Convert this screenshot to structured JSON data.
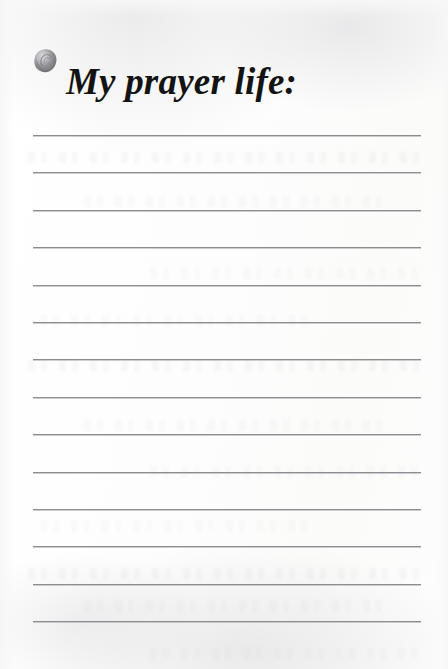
{
  "page": {
    "kind": "journal-prompt-page",
    "background_color": "#fdfdfc",
    "width": 448,
    "height": 669
  },
  "header": {
    "title": "My prayer life:",
    "title_color": "#131313",
    "ornament": {
      "icon_name": "rose-bud-icon",
      "description": "small grayscale rose bud illustration used as a bullet",
      "color_dark": "#6e6e70",
      "color_mid": "#95959a",
      "color_light": "#bcbcc0"
    }
  },
  "writing_area": {
    "line_color": "#8d8d90",
    "line_count": 14,
    "line_left": 33,
    "line_right": 421,
    "first_line_y": 135,
    "line_spacing": 37.4,
    "lines": [
      {
        "index": 1,
        "y": 135,
        "value": ""
      },
      {
        "index": 2,
        "y": 172,
        "value": ""
      },
      {
        "index": 3,
        "y": 210,
        "value": ""
      },
      {
        "index": 4,
        "y": 247,
        "value": ""
      },
      {
        "index": 5,
        "y": 285,
        "value": ""
      },
      {
        "index": 6,
        "y": 322,
        "value": ""
      },
      {
        "index": 7,
        "y": 359,
        "value": ""
      },
      {
        "index": 8,
        "y": 397,
        "value": ""
      },
      {
        "index": 9,
        "y": 434,
        "value": ""
      },
      {
        "index": 10,
        "y": 472,
        "value": ""
      },
      {
        "index": 11,
        "y": 509,
        "value": ""
      },
      {
        "index": 12,
        "y": 546,
        "value": ""
      },
      {
        "index": 13,
        "y": 584,
        "value": ""
      },
      {
        "index": 14,
        "y": 621,
        "value": ""
      }
    ]
  },
  "ghost_bleed": {
    "description": "faint text showing through from the reverse side of the paper",
    "rows_y": [
      152,
      196,
      268,
      315,
      360,
      420,
      466,
      520,
      568,
      600,
      648
    ]
  }
}
